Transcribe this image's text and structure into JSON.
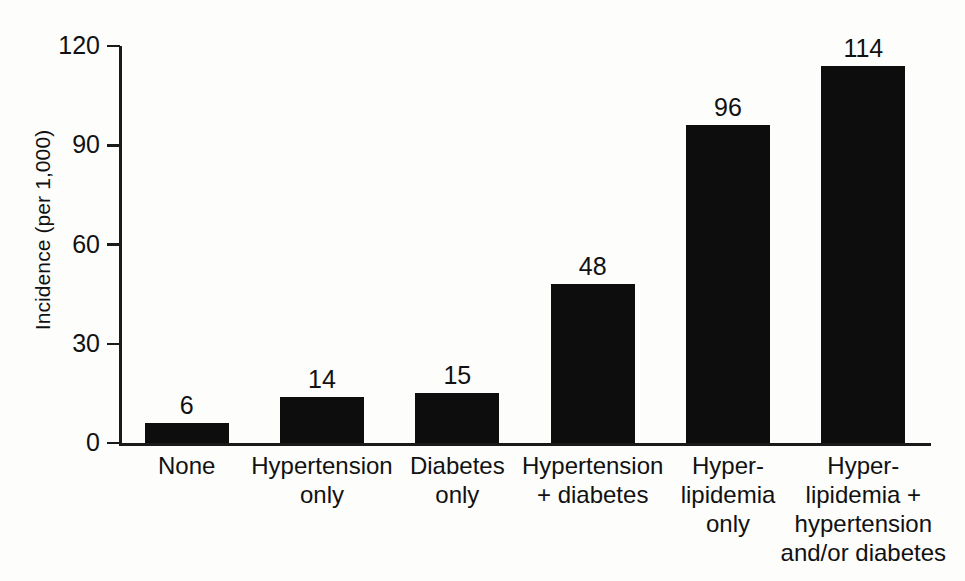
{
  "chart_data": {
    "type": "bar",
    "title": "",
    "subtitle": "",
    "xlabel": "",
    "ylabel": "Incidence (per 1,000)",
    "categories": [
      "None",
      "Hypertension\nonly",
      "Diabetes\nonly",
      "Hypertension\n+ diabetes",
      "Hyper-\nlipidemia\nonly",
      "Hyper-\nlipidemia +\nhypertension\nand/or diabetes"
    ],
    "values": [
      6,
      14,
      15,
      48,
      96,
      114
    ],
    "value_labels": [
      "6",
      "14",
      "15",
      "48",
      "96",
      "114"
    ],
    "ylim": [
      0,
      120
    ],
    "yticks": [
      0,
      30,
      60,
      90,
      120
    ],
    "ytick_labels": [
      "0",
      "30",
      "60",
      "90",
      "120"
    ],
    "grid": false,
    "legend": false,
    "bar_color": "#0d0d0d",
    "axis_color": "#1a1a1a",
    "background_color": "#fdfdfc"
  }
}
